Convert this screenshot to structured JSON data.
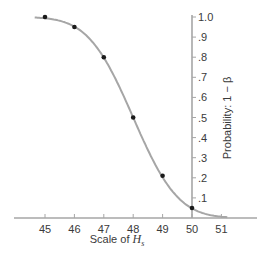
{
  "chart_data": {
    "type": "line",
    "title": "",
    "xlabel": "Scale of H",
    "xlabel_subscript": "s",
    "ylabel": "Probability: 1 − β",
    "x": [
      45,
      46,
      47,
      48,
      49,
      50
    ],
    "series": [
      {
        "name": "Power curve (1 − β)",
        "values": [
          1.0,
          0.95,
          0.8,
          0.5,
          0.21,
          0.05
        ],
        "marker": "circle",
        "smooth": true
      }
    ],
    "x_ticks": [
      "45",
      "46",
      "47",
      "48",
      "49",
      "50",
      "51"
    ],
    "y_ticks": [
      "1.0",
      ".9",
      ".8",
      ".7",
      ".6",
      ".5",
      ".4",
      ".3",
      ".2",
      ".1"
    ],
    "xlim": [
      44.0,
      52.2
    ],
    "ylim": [
      0,
      1.0
    ],
    "y_axis_position": "x = 50 (right side)",
    "grid": false,
    "legend": "none",
    "colors": {
      "curve": "#a6a6a6",
      "axis": "#a6a6a6",
      "marker": "#1a1a1a",
      "text": "#3a3a3a"
    }
  }
}
